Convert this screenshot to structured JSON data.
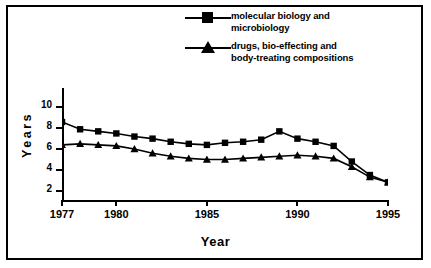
{
  "chart_data": {
    "type": "line",
    "title": "",
    "xlabel": "Year",
    "ylabel": "Years",
    "xlim": [
      1977,
      1995
    ],
    "ylim": [
      1,
      11
    ],
    "xticks": [
      1977,
      1980,
      1985,
      1990,
      1995
    ],
    "yticks": [
      2,
      4,
      6,
      8,
      10
    ],
    "grid": false,
    "legend_position": "top-center",
    "x": [
      1977,
      1978,
      1979,
      1980,
      1981,
      1982,
      1983,
      1984,
      1985,
      1986,
      1987,
      1988,
      1989,
      1990,
      1991,
      1992,
      1993,
      1994,
      1995
    ],
    "series": [
      {
        "name": "molecular biology and microbiology",
        "marker": "square",
        "values": [
          8.5,
          7.8,
          7.6,
          7.4,
          7.1,
          6.9,
          6.6,
          6.4,
          6.3,
          6.5,
          6.6,
          6.8,
          7.6,
          6.9,
          6.6,
          6.2,
          4.7,
          3.4,
          2.7
        ]
      },
      {
        "name": "drugs, bio-effecting and body-treating compositions",
        "marker": "triangle",
        "values": [
          6.3,
          6.4,
          6.3,
          6.2,
          5.9,
          5.5,
          5.2,
          5.0,
          4.9,
          4.9,
          5.0,
          5.1,
          5.2,
          5.3,
          5.2,
          5.0,
          4.2,
          3.2,
          2.7
        ]
      }
    ]
  },
  "legend": {
    "items": [
      {
        "label_line1": "molecular biology and",
        "label_line2": "microbiology",
        "marker": "square-marker"
      },
      {
        "label_line1": "drugs, bio-effecting and",
        "label_line2": "body-treating compositions",
        "marker": "triangle-marker"
      }
    ]
  },
  "axes": {
    "y_label": "Years",
    "x_label": "Year",
    "y_tick_labels": [
      "10",
      "8",
      "6",
      "4",
      "2"
    ],
    "x_tick_labels": [
      "1977",
      "1980",
      "1985",
      "1990",
      "1995"
    ]
  }
}
